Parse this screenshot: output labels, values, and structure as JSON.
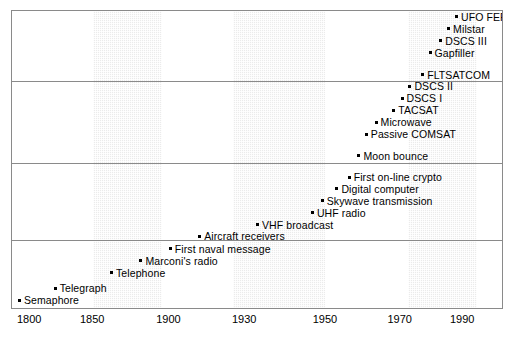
{
  "chart_data": {
    "type": "scatter",
    "title": "",
    "subtitle": "",
    "xlabel": "",
    "ylabel": "",
    "grid": false,
    "legend": null,
    "axis_note": "non-linear time axis; tick spacing compresses after 1900",
    "xticks": [
      {
        "label": "1800",
        "pos_pct": 1.2
      },
      {
        "label": "1850",
        "pos_pct": 16.5
      },
      {
        "label": "1900",
        "pos_pct": 32.0
      },
      {
        "label": "1930",
        "pos_pct": 47.4
      },
      {
        "label": "1950",
        "pos_pct": 63.8
      },
      {
        "label": "1970",
        "pos_pct": 79.0
      },
      {
        "label": "1990",
        "pos_pct": 94.2
      }
    ],
    "bands": [
      {
        "name": "band-1850s",
        "left_pct": 16.5,
        "right_pct": 30.7
      },
      {
        "name": "band-1930s",
        "left_pct": 45.1,
        "right_pct": 63.8
      },
      {
        "name": "band-1970s",
        "left_pct": 80.9,
        "right_pct": 94.9
      }
    ],
    "dividers": [
      {
        "name": "divider-1",
        "top_pct": 23.7
      },
      {
        "name": "divider-2",
        "top_pct": 51.2
      },
      {
        "name": "divider-3",
        "top_pct": 77.1
      }
    ],
    "events": [
      {
        "label": "UFO FEP",
        "year": 1993,
        "x_pct": 90.4,
        "y_pct": 2.0
      },
      {
        "label": "Milstar",
        "year": 1990,
        "x_pct": 88.8,
        "y_pct": 6.0
      },
      {
        "label": "DSCS III",
        "year": 1986,
        "x_pct": 87.2,
        "y_pct": 10.0
      },
      {
        "label": "Gapfiller",
        "year": 1982,
        "x_pct": 85.0,
        "y_pct": 14.0
      },
      {
        "label": "FLTSATCOM",
        "year": 1978,
        "x_pct": 83.5,
        "y_pct": 21.4
      },
      {
        "label": "DSCS II",
        "year": 1971,
        "x_pct": 80.9,
        "y_pct": 25.4
      },
      {
        "label": "DSCS I",
        "year": 1966,
        "x_pct": 79.3,
        "y_pct": 29.4
      },
      {
        "label": "TACSAT",
        "year": 1969,
        "x_pct": 77.6,
        "y_pct": 33.4
      },
      {
        "label": "Microwave",
        "year": 1964,
        "x_pct": 74.0,
        "y_pct": 37.5
      },
      {
        "label": "Passive COMSAT",
        "year": 1960,
        "x_pct": 72.0,
        "y_pct": 41.5
      },
      {
        "label": "Moon bounce",
        "year": 1954,
        "x_pct": 70.5,
        "y_pct": 48.8
      },
      {
        "label": "First on-line crypto",
        "year": 1950,
        "x_pct": 68.5,
        "y_pct": 55.9
      },
      {
        "label": "Digital computer",
        "year": 1946,
        "x_pct": 66.0,
        "y_pct": 59.9
      },
      {
        "label": "Skywave transmission",
        "year": 1943,
        "x_pct": 63.0,
        "y_pct": 63.9
      },
      {
        "label": "UHF radio",
        "year": 1940,
        "x_pct": 61.0,
        "y_pct": 67.9
      },
      {
        "label": "VHF broadcast",
        "year": 1936,
        "x_pct": 49.8,
        "y_pct": 71.9
      },
      {
        "label": "Aircraft receivers",
        "year": 1928,
        "x_pct": 38.0,
        "y_pct": 75.9
      },
      {
        "label": "First naval message",
        "year": 1916,
        "x_pct": 32.0,
        "y_pct": 80.1
      },
      {
        "label": "Marconi's radio",
        "year": 1901,
        "x_pct": 26.0,
        "y_pct": 84.1
      },
      {
        "label": "Telephone",
        "year": 1876,
        "x_pct": 20.0,
        "y_pct": 88.1
      },
      {
        "label": "Telegraph",
        "year": 1844,
        "x_pct": 8.5,
        "y_pct": 93.4
      },
      {
        "label": "Semaphore",
        "year": 1800,
        "x_pct": 1.2,
        "y_pct": 97.4
      }
    ]
  }
}
